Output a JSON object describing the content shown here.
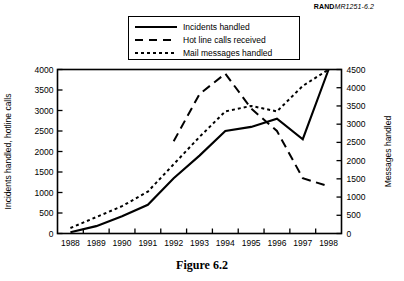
{
  "report_id": {
    "bold": "RAND",
    "italic": "MR1251-6.2"
  },
  "caption": "Figure 6.2",
  "legend": {
    "items": [
      {
        "label": "Incidents handled",
        "style": "solid",
        "key_icon": "solid-line-icon"
      },
      {
        "label": "Hot line calls received",
        "style": "dashed",
        "key_icon": "dashed-line-icon"
      },
      {
        "label": "Mail messages handled",
        "style": "dotted",
        "key_icon": "dotted-line-icon"
      }
    ]
  },
  "chart_data": {
    "type": "line",
    "title": "Figure 6.2",
    "xlabel": "",
    "ylabel": "Incidents handled, hotline calls",
    "y2label": "Messages handled",
    "grid": false,
    "legend_position": "top-center",
    "x": [
      1988,
      1989,
      1990,
      1991,
      1992,
      1993,
      1994,
      1995,
      1996,
      1997,
      1998
    ],
    "categories": [
      "1988",
      "1989",
      "1990",
      "1991",
      "1992",
      "1993",
      "1994",
      "1995",
      "1996",
      "1997",
      "1998"
    ],
    "ylim": [
      0,
      4000
    ],
    "yticks": [
      0,
      500,
      1000,
      1500,
      2000,
      2500,
      3000,
      3500,
      4000
    ],
    "ytick_labels": [
      "0",
      "500",
      "1000",
      "1500",
      "2000",
      "2500",
      "3000",
      "3500",
      "4000"
    ],
    "y2lim": [
      0,
      4500
    ],
    "y2ticks": [
      0,
      500,
      1000,
      1500,
      2000,
      2500,
      3000,
      3500,
      4000,
      4500
    ],
    "y2tick_labels": [
      "0",
      "500",
      "1000",
      "1500",
      "2000",
      "2500",
      "3000",
      "3500",
      "4000",
      "4500"
    ],
    "xtick_labels": [
      "1988",
      "1989",
      "1990",
      "1991",
      "1992",
      "1993",
      "1994",
      "1995",
      "1996",
      "1997",
      "1998"
    ],
    "series": [
      {
        "name": "Incidents handled",
        "style": "solid",
        "axis": "left",
        "x": [
          1988,
          1989,
          1990,
          1991,
          1992,
          1993,
          1994,
          1995,
          1996,
          1997,
          1998
        ],
        "values": [
          30,
          180,
          420,
          700,
          1350,
          1900,
          2500,
          2600,
          2800,
          2300,
          4000
        ]
      },
      {
        "name": "Hot line calls received",
        "style": "dashed",
        "axis": "left",
        "x": [
          1992,
          1993,
          1994,
          1995,
          1996,
          1997,
          1998
        ],
        "values": [
          2250,
          3400,
          3900,
          3050,
          2500,
          1350,
          1150
        ]
      },
      {
        "name": "Mail messages handled",
        "style": "dotted",
        "axis": "right",
        "x": [
          1988,
          1989,
          1990,
          1991,
          1992,
          1993,
          1994,
          1995,
          1996,
          1997,
          1998
        ],
        "values": [
          150,
          450,
          750,
          1150,
          1900,
          2650,
          3350,
          3500,
          3350,
          4050,
          4500
        ]
      }
    ]
  }
}
